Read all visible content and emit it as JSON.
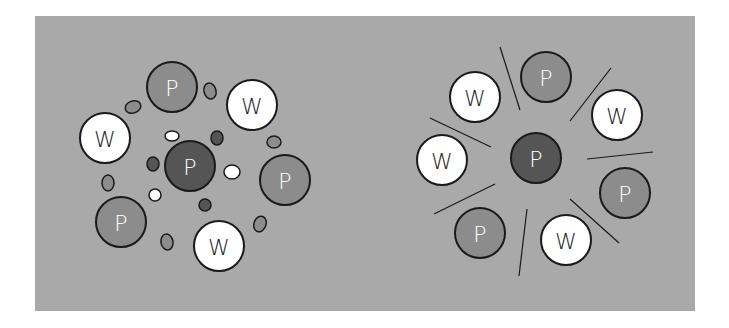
{
  "colors": {
    "background": "#a9a9a9",
    "protein_center": "#555555",
    "protein": "#8c8c8c",
    "water": "#ffffff",
    "outline": "#1a1a1a",
    "drop_gray": "#8c8c8c",
    "drop_dark": "#555555",
    "drop_white": "#ffffff"
  },
  "left_diagram": {
    "center": {
      "label": "P",
      "type": "protein-center"
    },
    "ring": [
      {
        "label": "P",
        "type": "protein"
      },
      {
        "label": "W",
        "type": "water"
      },
      {
        "label": "P",
        "type": "protein"
      },
      {
        "label": "W",
        "type": "water"
      },
      {
        "label": "P",
        "type": "protein"
      },
      {
        "label": "W",
        "type": "water"
      }
    ]
  },
  "right_diagram": {
    "center": {
      "label": "P",
      "type": "protein-center"
    },
    "ring": [
      {
        "label": "P",
        "type": "protein"
      },
      {
        "label": "W",
        "type": "water"
      },
      {
        "label": "P",
        "type": "protein"
      },
      {
        "label": "W",
        "type": "water"
      },
      {
        "label": "P",
        "type": "protein"
      },
      {
        "label": "W",
        "type": "water"
      },
      {
        "label": "W",
        "type": "water"
      }
    ]
  }
}
